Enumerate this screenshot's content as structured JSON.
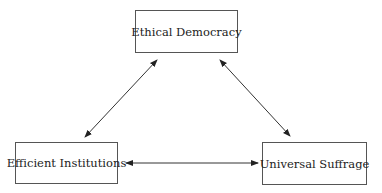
{
  "diagram": {
    "nodes": [
      {
        "id": "ethical-democracy",
        "label": "Ethical Democracy"
      },
      {
        "id": "efficient-institutions",
        "label": "Efficient Institutions"
      },
      {
        "id": "universal-suffrage",
        "label": "Universal Suffrage"
      }
    ],
    "edges": [
      {
        "from": "ethical-democracy",
        "to": "efficient-institutions",
        "type": "bidirectional"
      },
      {
        "from": "ethical-democracy",
        "to": "universal-suffrage",
        "type": "bidirectional"
      },
      {
        "from": "efficient-institutions",
        "to": "universal-suffrage",
        "type": "bidirectional"
      }
    ],
    "colors": {
      "line": "#333333",
      "border": "#555555",
      "background": "#ffffff"
    }
  }
}
